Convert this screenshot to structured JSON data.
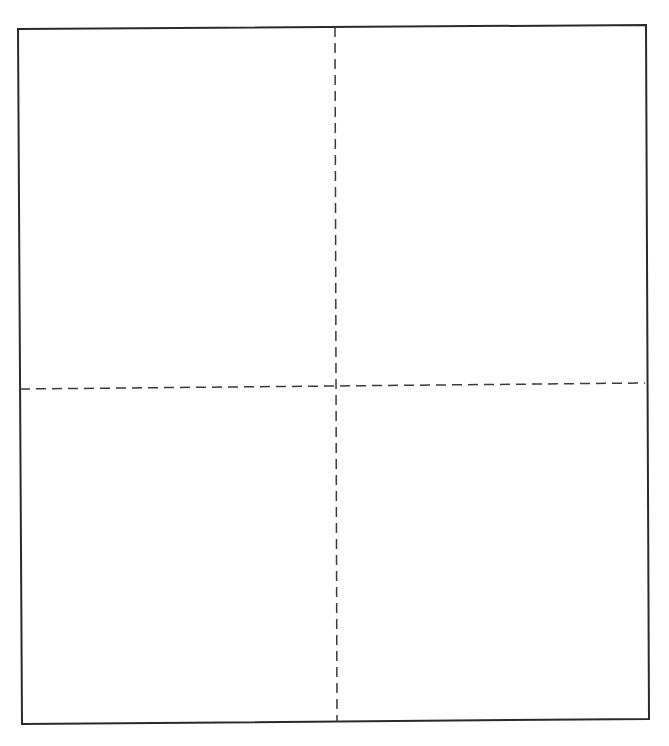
{
  "canvas": {
    "width": 669,
    "height": 746,
    "background": "#ffffff"
  },
  "diagram": {
    "type": "quadrant-grid",
    "quadrant_count": 4,
    "colors": {
      "frame_stroke": "#2a2a2a",
      "divider_stroke": "#3a3a3a"
    },
    "frame": {
      "shape": "rectangle",
      "style": "solid",
      "stroke_width": 2,
      "corners": {
        "top_left": [
          18,
          29
        ],
        "top_right": [
          646,
          25
        ],
        "bottom_right": [
          649,
          719
        ],
        "bottom_left": [
          22,
          724
        ]
      }
    },
    "dividers": [
      {
        "name": "vertical-divider",
        "style": "dashed",
        "stroke_width": 1.5,
        "dash": "10 6",
        "from": [
          335,
          27
        ],
        "to": [
          337,
          722
        ]
      },
      {
        "name": "horizontal-divider",
        "style": "dashed",
        "stroke_width": 1.5,
        "dash": "10 6",
        "from": [
          20,
          389
        ],
        "to": [
          645,
          383
        ]
      }
    ]
  }
}
